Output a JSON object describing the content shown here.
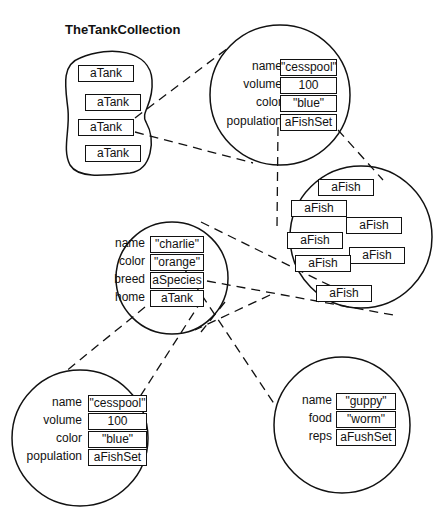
{
  "title": "TheTankCollection",
  "collection": {
    "items": [
      "aTank",
      "aTank",
      "aTank",
      "aTank"
    ]
  },
  "tank_top": {
    "fields": [
      {
        "label": "name",
        "value": "\"cesspool\""
      },
      {
        "label": "volume",
        "value": "100"
      },
      {
        "label": "color",
        "value": "\"blue\""
      },
      {
        "label": "population",
        "value": "aFishSet"
      }
    ]
  },
  "fish_set": {
    "items": [
      "aFish",
      "aFish",
      "aFish",
      "aFish",
      "aFish",
      "aFish",
      "aFish"
    ]
  },
  "fish": {
    "fields": [
      {
        "label": "name",
        "value": "\"charlie\""
      },
      {
        "label": "color",
        "value": "\"orange\""
      },
      {
        "label": "breed",
        "value": "aSpecies"
      },
      {
        "label": "home",
        "value": "aTank"
      }
    ]
  },
  "tank_bottom": {
    "fields": [
      {
        "label": "name",
        "value": "\"cesspool\""
      },
      {
        "label": "volume",
        "value": "100"
      },
      {
        "label": "color",
        "value": "\"blue\""
      },
      {
        "label": "population",
        "value": "aFishSet"
      }
    ]
  },
  "species": {
    "fields": [
      {
        "label": "name",
        "value": "\"guppy\""
      },
      {
        "label": "food",
        "value": "\"worm\""
      },
      {
        "label": "reps",
        "value": "aFushSet"
      }
    ]
  }
}
